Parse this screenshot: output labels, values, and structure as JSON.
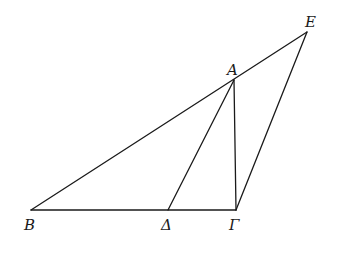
{
  "diagram": {
    "type": "geometric-figure",
    "points": {
      "A": {
        "label": "A",
        "x": 234,
        "y": 80
      },
      "B": {
        "label": "B",
        "x": 31,
        "y": 210
      },
      "Gamma": {
        "label": "Γ",
        "x": 236,
        "y": 210
      },
      "Delta": {
        "label": "Δ",
        "x": 168,
        "y": 210
      },
      "E": {
        "label": "E",
        "x": 307,
        "y": 32
      }
    },
    "segments": [
      [
        "B",
        "E"
      ],
      [
        "B",
        "Gamma"
      ],
      [
        "A",
        "Delta"
      ],
      [
        "A",
        "Gamma"
      ],
      [
        "Gamma",
        "E"
      ]
    ],
    "line_color": "#1a1a1a",
    "background": "#ffffff"
  }
}
